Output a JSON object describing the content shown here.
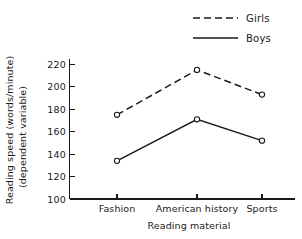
{
  "chart_data": {
    "type": "line",
    "title": "",
    "subtitle": "",
    "xlabel": "Reading material",
    "ylabel_line1": "Reading speed (words/minute)",
    "ylabel_line2": "(dependent variable)",
    "categories": [
      "Fashion",
      "American history",
      "Sports"
    ],
    "series": [
      {
        "name": "Girls",
        "values": [
          175,
          215,
          193
        ],
        "style": "dashed",
        "color": "#1a1a1a",
        "marker": "open-circle"
      },
      {
        "name": "Boys",
        "values": [
          134,
          171,
          152
        ],
        "style": "solid",
        "color": "#1a1a1a",
        "marker": "open-circle"
      }
    ],
    "ylim": [
      100,
      220
    ],
    "ytick_values": [
      100,
      120,
      140,
      160,
      180,
      200,
      220
    ],
    "ytick_labels": [
      "100",
      "120",
      "140",
      "160",
      "180",
      "200",
      "220"
    ],
    "ytick_step": 20,
    "xlim_categories_count": 3,
    "grid": false,
    "legend_position": "top-right",
    "legend_entries": [
      "Girls",
      "Boys"
    ],
    "background_color": "#ffffff",
    "axis_color": "#1a1a1a"
  },
  "axis": {
    "y_title_line1": "Reading speed (words/minute)",
    "y_title_line2": "(dependent variable)",
    "x_title": "Reading material"
  },
  "legend": {
    "girls_label": "Girls",
    "boys_label": "Boys"
  },
  "ticks": {
    "y": [
      "220",
      "200",
      "180",
      "160",
      "140",
      "120",
      "100"
    ],
    "x": [
      "Fashion",
      "American history",
      "Sports"
    ]
  }
}
